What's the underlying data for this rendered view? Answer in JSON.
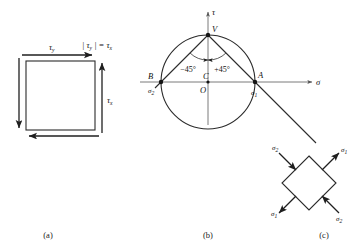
{
  "figure": {
    "captions": {
      "a": "(a)",
      "b": "(b)",
      "c": "(c)"
    },
    "colors": {
      "ink": "#1a1a1a",
      "line": "#2b2b2b",
      "axis": "#6b6b6b",
      "background": "#ffffff"
    }
  },
  "panel_a": {
    "name": "shear-element",
    "labels": {
      "tau_y": "τ",
      "tau_y_sub": "y",
      "tau_x": "τ",
      "tau_x_sub": "x",
      "relation": "| τ",
      "relation_sub1": "y",
      "relation_mid": " | = τ",
      "relation_sub2": "x"
    }
  },
  "panel_b": {
    "name": "mohr-circle",
    "axes": {
      "tau_axis": "τ",
      "sigma_axis": "σ"
    },
    "points": {
      "V": "V",
      "C": "C",
      "O": "O",
      "A": "A",
      "B": "B"
    },
    "stress_labels": {
      "sigma_1": "σ",
      "sigma_1_sub": "1",
      "sigma_2": "σ",
      "sigma_2_sub": "2"
    },
    "angles": {
      "negative": "−45°",
      "positive": "+45°"
    }
  },
  "panel_c": {
    "name": "rotated-principal-element",
    "labels": {
      "sigma_1_tr": "σ",
      "sigma_1_tr_sub": "1",
      "sigma_1_bl": "σ",
      "sigma_1_bl_sub": "1",
      "sigma_2_tl": "σ",
      "sigma_2_tl_sub": "2",
      "sigma_2_br": "σ",
      "sigma_2_br_sub": "2"
    }
  }
}
